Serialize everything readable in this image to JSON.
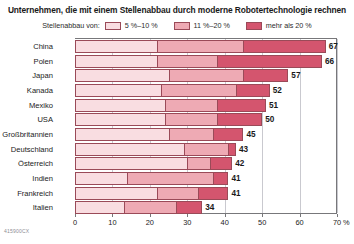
{
  "title": "Unternehmen, die mit einem Stellenabbau durch moderne Robotertechnologie rechnen",
  "legend": {
    "caption": "Stellenabbau von:",
    "items": [
      {
        "label": "5 %–10 %",
        "color": "#f9dde1"
      },
      {
        "label": "11 %–20 %",
        "color": "#eeaab4"
      },
      {
        "label": "mehr als 20 %",
        "color": "#d4556e"
      }
    ]
  },
  "axis": {
    "unit": "%",
    "ticks": [
      0,
      10,
      20,
      30,
      40,
      50,
      60,
      70
    ],
    "min": 0,
    "max": 70
  },
  "source_code": "415900CX",
  "chart_data": {
    "type": "bar",
    "orientation": "horizontal",
    "stacked": true,
    "title": "Unternehmen, die mit einem Stellenabbau durch moderne Robotertechnologie rechnen",
    "xlabel": "%",
    "ylabel": "",
    "xlim": [
      0,
      70
    ],
    "grid": true,
    "legend_position": "top",
    "categories": [
      "China",
      "Polen",
      "Japan",
      "Kanada",
      "Mexiko",
      "USA",
      "Großbritannien",
      "Deutschland",
      "Österreich",
      "Indien",
      "Frankreich",
      "Italien"
    ],
    "series": [
      {
        "name": "5 %–10 %",
        "color": "#f9dde1",
        "values": [
          22,
          22,
          25,
          23,
          24,
          24,
          25,
          29,
          30,
          14,
          22,
          13
        ]
      },
      {
        "name": "11 %–20 %",
        "color": "#eeaab4",
        "values": [
          23,
          16,
          20,
          20,
          14,
          14,
          12,
          12,
          6,
          23,
          11,
          14
        ]
      },
      {
        "name": "mehr als 20 %",
        "color": "#d4556e",
        "values": [
          22,
          28,
          12,
          9,
          13,
          12,
          8,
          2,
          6,
          4,
          8,
          7
        ]
      }
    ],
    "totals": [
      67,
      66,
      57,
      52,
      51,
      50,
      45,
      43,
      42,
      41,
      41,
      34
    ],
    "total_labels": [
      "67",
      "66",
      "57",
      "52",
      "51",
      "50",
      "45",
      "43",
      "42",
      "41",
      "41",
      "34"
    ]
  }
}
